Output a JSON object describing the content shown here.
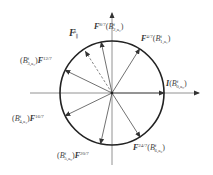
{
  "diagram": {
    "type": "phasor-circle",
    "center": [
      112,
      93
    ],
    "radius": 52,
    "axes": {
      "horizontal": {
        "from": [
          30,
          93
        ],
        "to": [
          200,
          93
        ]
      },
      "vertical": {
        "from": [
          112,
          165
        ],
        "to": [
          112,
          12
        ]
      }
    },
    "vectors": [
      {
        "id": "I",
        "angle_deg": 0,
        "style": "solid"
      },
      {
        "id": "F4_7",
        "angle_deg": 58,
        "style": "solid"
      },
      {
        "id": "F8_7",
        "angle_deg": 102,
        "style": "solid"
      },
      {
        "id": "F_parallel",
        "angle_deg": 123,
        "style": "dashed"
      },
      {
        "id": "F12_7",
        "angle_deg": 154,
        "style": "solid"
      },
      {
        "id": "F16_7",
        "angle_deg": 206,
        "style": "solid"
      },
      {
        "id": "F20_7",
        "angle_deg": 257,
        "style": "solid"
      },
      {
        "id": "F24_7",
        "angle_deg": 302,
        "style": "solid"
      }
    ],
    "labels": {
      "f_parallel": {
        "main": "F",
        "sub": "∥",
        "sup": "a"
      },
      "f8_7": {
        "main": "F",
        "sup": "8/7",
        "b": "B",
        "bsup": "f",
        "bsub": "2,a₂"
      },
      "f4_7": {
        "main": "F",
        "sup": "4/7",
        "b": "B",
        "bsup": "f",
        "bsub": "1,a₁"
      },
      "f12_7": {
        "main": "F",
        "sup": "12/7",
        "b": "B",
        "bsup": "f",
        "bsub": "3,a₃"
      },
      "i": {
        "main": "I",
        "b": "B",
        "bsup": "f",
        "bsub": "0,a₀"
      },
      "f16_7": {
        "main": "F",
        "sup": "16/7",
        "b": "B",
        "bsup": "f",
        "bsub": "4,a₄"
      },
      "f20_7": {
        "main": "F",
        "sup": "20/7",
        "b": "B",
        "bsup": "f",
        "bsub": "5,a₅"
      },
      "f24_7": {
        "main": "F",
        "sup": "24/7",
        "b": "B",
        "bsup": "f",
        "bsub": "6,a₆"
      }
    }
  }
}
